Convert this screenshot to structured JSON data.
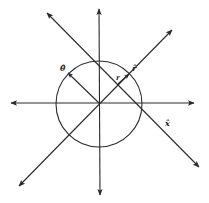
{
  "diagram": {
    "colors": {
      "stroke": "#2a2a2a",
      "background": "#ffffff"
    },
    "center": [
      99,
      103
    ],
    "circle_radius": 43,
    "labels": {
      "theta_hat": "θ̂",
      "r": "r",
      "r_hat": "r̂",
      "x_hat": "x̂"
    }
  }
}
